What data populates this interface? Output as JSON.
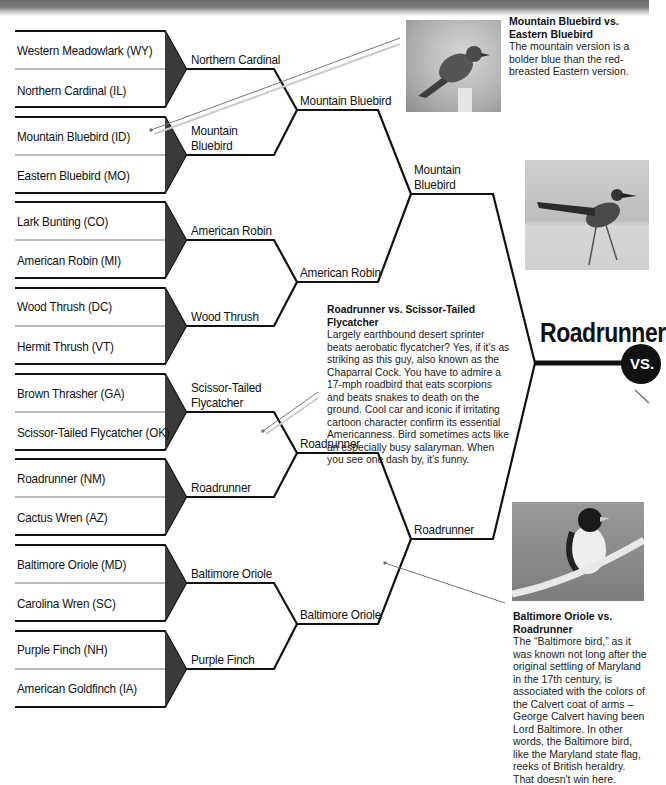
{
  "round1": [
    {
      "a": "Western Meadowlark (WY)",
      "b": "Northern Cardinal (IL)"
    },
    {
      "a": "Mountain Bluebird (ID)",
      "b": "Eastern Bluebird (MO)"
    },
    {
      "a": "Lark Bunting (CO)",
      "b": "American Robin (MI)"
    },
    {
      "a": "Wood Thrush (DC)",
      "b": "Hermit Thrush (VT)"
    },
    {
      "a": "Brown Thrasher (GA)",
      "b": "Scissor-Tailed Flycatcher (OK)"
    },
    {
      "a": "Roadrunner (NM)",
      "b": "Cactus Wren (AZ)"
    },
    {
      "a": "Baltimore Oriole (MD)",
      "b": "Carolina Wren (SC)"
    },
    {
      "a": "Purple Finch (NH)",
      "b": "American Goldfinch (IA)"
    }
  ],
  "round2": [
    "Northern Cardinal",
    "Mountain Bluebird",
    "American Robin",
    "Wood Thrush",
    "Scissor-Tailed Flycatcher",
    "Roadrunner",
    "Baltimore Oriole",
    "Purple Finch"
  ],
  "round3": [
    "Mountain Bluebird",
    "American Robin",
    "Roadrunner",
    "Baltimore Oriole"
  ],
  "round4": [
    "Mountain Bluebird",
    "Roadrunner"
  ],
  "champion": "Roadrunner",
  "vs_label": "VS.",
  "notes": {
    "bluebird": {
      "title": "Mountain Bluebird vs. Eastern Bluebird",
      "body": "The mountain version is a bolder blue than the red-breasted Eastern version."
    },
    "roadrunner": {
      "title": "Roadrunner vs. Scissor-Tailed Flycatcher",
      "body": "Largely earthbound desert sprinter beats aerobatic flycatcher? Yes, if it's as striking as this guy, also known as the Chaparral Cock. You have to admire a 17-mph roadbird that eats scorpions and beats snakes to death on the ground. Cool car and iconic if irritating cartoon character confirm its essential Americanness. Bird sometimes acts like an especially busy salaryman. When you see one dash by, it's funny."
    },
    "oriole": {
      "title": "Baltimore Oriole vs. Roadrunner",
      "body": "The “Baltimore bird,” as it was known not long after the original settling of Maryland in the 17th century, is associated with the colors of the Calvert coat of arms – George Calvert having been Lord Baltimore. In other words, the Baltimore bird, like the Maryland state flag, reeks of British heraldry. That doesn't win here."
    }
  },
  "photos": {
    "bluebird": "mountain-bluebird-photo",
    "roadrunner": "roadrunner-photo",
    "oriole": "baltimore-oriole-photo"
  },
  "colors": {
    "line": "#111111",
    "triangle": "#3a3a3a",
    "pointer": "#777777"
  }
}
